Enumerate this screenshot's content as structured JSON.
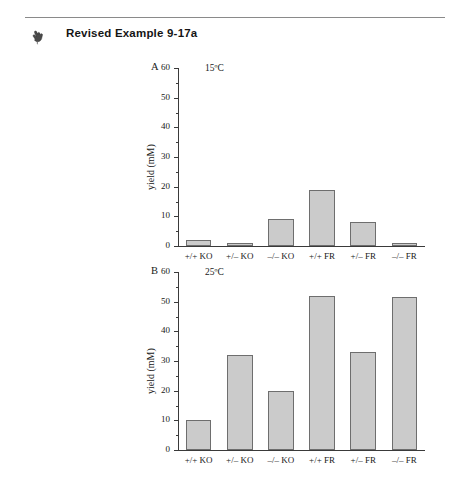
{
  "header": {
    "title": "Revised Example 9-17a",
    "icon": "pointing-hand-icon"
  },
  "bottom_caption": "",
  "chart_data": [
    {
      "panel": "A",
      "type": "bar",
      "title": "15ºC",
      "xlabel": "",
      "ylabel": "yield (mM)",
      "categories": [
        "+/+ KO",
        "+/– KO",
        "–/– KO",
        "+/+ FR",
        "+/– FR",
        "–/– FR"
      ],
      "values": [
        2,
        1,
        9,
        19,
        8,
        1
      ],
      "ylim": [
        0,
        60
      ],
      "ytick_labels": [
        "0",
        "10",
        "20",
        "30",
        "40",
        "50",
        "60"
      ],
      "ytick_values": [
        0,
        10,
        20,
        30,
        40,
        50,
        60
      ],
      "yminor_values": [
        5,
        15,
        25,
        35,
        45,
        55
      ],
      "grid": false,
      "legend": "none",
      "bar_fill": "#cbcbcb",
      "bar_stroke": "#6e6e6e"
    },
    {
      "panel": "B",
      "type": "bar",
      "title": "25ºC",
      "xlabel": "",
      "ylabel": "yield (mM)",
      "categories": [
        "+/+ KO",
        "+/– KO",
        "–/– KO",
        "+/+ FR",
        "+/– FR",
        "–/– FR"
      ],
      "values": [
        10,
        32,
        20,
        52,
        33,
        51.5
      ],
      "ylim": [
        0,
        60
      ],
      "ytick_labels": [
        "0",
        "10",
        "20",
        "30",
        "40",
        "50",
        "60"
      ],
      "ytick_values": [
        0,
        10,
        20,
        30,
        40,
        50,
        60
      ],
      "yminor_values": [
        5,
        15,
        25,
        35,
        45,
        55
      ],
      "grid": false,
      "legend": "none",
      "bar_fill": "#cbcbcb",
      "bar_stroke": "#6e6e6e"
    }
  ]
}
